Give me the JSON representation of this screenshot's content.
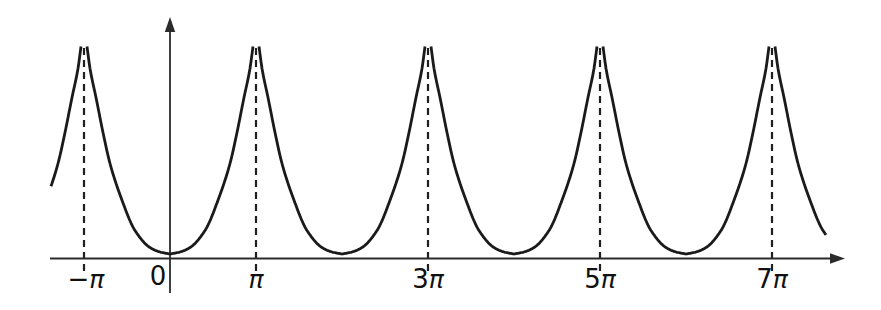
{
  "chart_data": {
    "type": "line",
    "title": "",
    "period": "2π",
    "x_ticks": [
      {
        "prefix": "−",
        "pi": "π",
        "multiple": -1,
        "dx": 2,
        "dy": 0
      },
      {
        "prefix": "0",
        "pi": "",
        "multiple": 0,
        "dx": -12,
        "dy": -3
      },
      {
        "prefix": "",
        "pi": "π",
        "multiple": 1,
        "dx": 0,
        "dy": 0
      },
      {
        "prefix": "3",
        "pi": "π",
        "multiple": 3,
        "dx": 0,
        "dy": 0
      },
      {
        "prefix": "5",
        "pi": "π",
        "multiple": 5,
        "dx": 0,
        "dy": 0
      },
      {
        "prefix": "7",
        "pi": "π",
        "multiple": 7,
        "dx": 0,
        "dy": 0
      }
    ],
    "asymptote_multiples_of_pi": [
      -1,
      1,
      3,
      5,
      7
    ],
    "minima_multiples_of_pi": [
      0,
      2,
      4,
      6
    ],
    "minimum_height_px": 4.5,
    "layout": {
      "width": 881,
      "height": 310,
      "axis_y": 258.5,
      "origin_x": 170,
      "px_per_pi": 86,
      "x_axis_start": 50,
      "x_axis_line_end": 832,
      "x_arrow_tip": 845,
      "y_axis_bottom": 293,
      "y_axis_line_top": 31,
      "y_arrow_tip": 17,
      "curve_x_start": 51,
      "curve_x_end": 826,
      "tip_half_width": 3,
      "dash_top_y": 48,
      "dash_bottom_y": 273,
      "dash_pattern": "7 5",
      "label_baseline_y": 288,
      "profile_d_vs_h": [
        [
          3,
          212
        ],
        [
          6,
          190
        ],
        [
          12,
          161
        ],
        [
          19,
          126
        ],
        [
          26,
          95
        ],
        [
          37,
          61
        ],
        [
          51,
          28
        ],
        [
          66,
          11
        ],
        [
          76,
          6.5
        ],
        [
          86,
          4.5
        ]
      ],
      "colors": {
        "curve": "#1a1a1a",
        "axis": "#2b2b2b",
        "dash": "#1f1f1f",
        "label": "#111111",
        "background": "#ffffff"
      }
    }
  }
}
